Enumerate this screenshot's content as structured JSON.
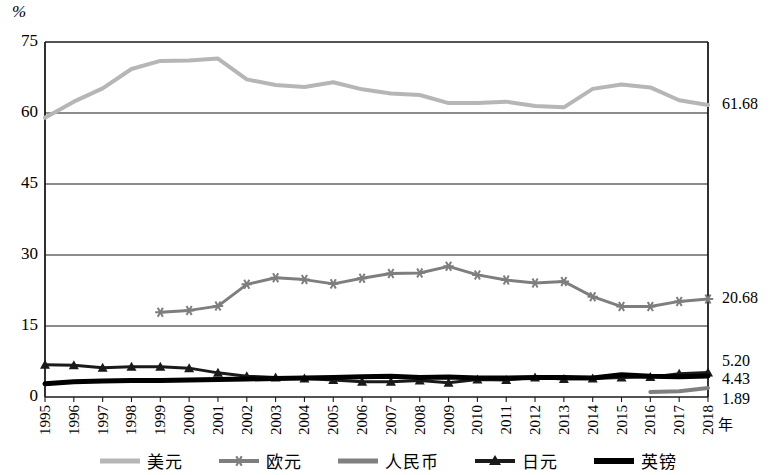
{
  "chart_data": {
    "type": "line",
    "title": "",
    "xlabel": "年",
    "ylabel": "%",
    "ylim": [
      0,
      75
    ],
    "yticks": [
      0,
      15,
      30,
      45,
      60,
      75
    ],
    "grid": true,
    "legend_position": "bottom",
    "x": [
      1995,
      1996,
      1997,
      1998,
      1999,
      2000,
      2001,
      2002,
      2003,
      2004,
      2005,
      2006,
      2007,
      2008,
      2009,
      2010,
      2011,
      2012,
      2013,
      2014,
      2015,
      2016,
      2017,
      2018
    ],
    "xticklabels": [
      "1995",
      "1996",
      "1997",
      "1998",
      "1999",
      "2000",
      "2001",
      "2002",
      "2003",
      "2004",
      "2005",
      "2006",
      "2007",
      "2008",
      "2009",
      "2010",
      "2011",
      "2012",
      "2013",
      "2014",
      "2015",
      "2016",
      "2017",
      "2018"
    ],
    "series": [
      {
        "name": "美元",
        "color": "#b6b6b6",
        "marker": "none",
        "width": 4,
        "end_label": "61.68",
        "values": [
          59.0,
          62.4,
          65.2,
          69.3,
          71.0,
          71.1,
          71.5,
          67.1,
          65.9,
          65.5,
          66.5,
          65.0,
          64.1,
          63.8,
          62.1,
          62.1,
          62.4,
          61.5,
          61.2,
          65.1,
          66.0,
          65.4,
          62.7,
          61.68
        ]
      },
      {
        "name": "欧元",
        "color": "#7e7e7e",
        "marker": "asterisk",
        "width": 3,
        "end_label": "20.68",
        "values": [
          null,
          null,
          null,
          null,
          17.9,
          18.3,
          19.2,
          23.8,
          25.2,
          24.8,
          23.9,
          25.1,
          26.1,
          26.2,
          27.6,
          25.8,
          24.7,
          24.1,
          24.4,
          21.2,
          19.1,
          19.1,
          20.2,
          20.68
        ]
      },
      {
        "name": "人民币",
        "color": "#808080",
        "marker": "none",
        "width": 4,
        "end_label": "1.89",
        "values": [
          null,
          null,
          null,
          null,
          null,
          null,
          null,
          null,
          null,
          null,
          null,
          null,
          null,
          null,
          null,
          null,
          null,
          null,
          null,
          null,
          null,
          1.08,
          1.23,
          1.89
        ]
      },
      {
        "name": "日元",
        "color": "#1a1a1a",
        "marker": "triangle",
        "width": 3,
        "end_label": "5.20",
        "values": [
          6.8,
          6.7,
          6.2,
          6.4,
          6.4,
          6.1,
          5.1,
          4.4,
          4.1,
          3.9,
          3.6,
          3.2,
          3.2,
          3.5,
          3.0,
          3.7,
          3.6,
          4.1,
          3.8,
          3.9,
          4.1,
          4.2,
          4.9,
          5.2
        ]
      },
      {
        "name": "英镑",
        "color": "#000000",
        "marker": "none",
        "width": 5,
        "end_label": "4.43",
        "values": [
          2.8,
          3.2,
          3.4,
          3.5,
          3.5,
          3.6,
          3.7,
          3.8,
          3.9,
          4.0,
          4.1,
          4.3,
          4.4,
          4.1,
          4.2,
          4.0,
          4.0,
          4.1,
          4.1,
          4.0,
          4.7,
          4.4,
          4.3,
          4.43
        ]
      }
    ]
  },
  "axes": {
    "unit": "%",
    "x_title": "年"
  },
  "legend": {
    "items": [
      {
        "label": "美元"
      },
      {
        "label": "欧元"
      },
      {
        "label": "人民币"
      },
      {
        "label": "日元"
      },
      {
        "label": "英镑"
      }
    ]
  },
  "end_labels": [
    {
      "text": "61.68"
    },
    {
      "text": "20.68"
    },
    {
      "text": "5.20"
    },
    {
      "text": "4.43"
    },
    {
      "text": "1.89"
    }
  ]
}
